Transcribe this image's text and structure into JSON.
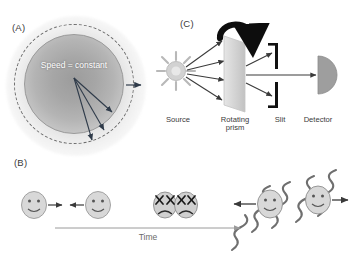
{
  "figure": {
    "background": "#ffffff",
    "panels": [
      {
        "id": "A",
        "label": "(A)"
      },
      {
        "id": "B",
        "label": "(B)"
      },
      {
        "id": "C",
        "label": "(C)"
      }
    ]
  },
  "panel_a": {
    "label": "(A)",
    "caption_text": "Speed = constant",
    "description": "Expanding spherical light wavefront from a point source",
    "ring_style": "dashed",
    "ring_color": "#6e6e6e",
    "disc_fill_center": "#9c9c9c",
    "disc_fill_edge": "#dcdcdc",
    "text_color": "#ffffff",
    "arrow_color": "#2f3b4a",
    "arrow_count": 3,
    "expansion_arrow": "outward-radial-arrow"
  },
  "panel_b": {
    "label": "(B)",
    "axis_label": "Time",
    "axis_color": "#9a9a9a",
    "face_fill": "#d8d8d8",
    "face_stroke": "#8c8c8c",
    "arrow_color": "#3a3a3a",
    "wave_color": "#6f6f6f",
    "stages": [
      {
        "name": "approach",
        "faces": 2,
        "expression": "smiling",
        "motion": "toward-each-other"
      },
      {
        "name": "collision",
        "faces": 2,
        "expression": "x-eyes-frowning",
        "motion": "contact"
      },
      {
        "name": "separate",
        "faces": 2,
        "expression": "smiling",
        "motion": "away-from-each-other",
        "emission": "helical-waves"
      }
    ]
  },
  "panel_c": {
    "label": "(C)",
    "description": "Rotating prism apparatus for measuring the speed of light",
    "components": [
      {
        "name": "source",
        "label": "Source",
        "icon": "sun-burst-icon",
        "fill": "#cfcfcf"
      },
      {
        "name": "rotating-prism",
        "label": "Rotating\nprism",
        "icon": "prism-icon",
        "fill": "#d6d6d6",
        "indicator": "rotation-arrow"
      },
      {
        "name": "slit",
        "label": "Slit",
        "icon": "slit-icon",
        "fill": "#111111"
      },
      {
        "name": "detector",
        "label": "Detector",
        "icon": "detector-icon",
        "fill": "#9e9e9e"
      }
    ],
    "beam_color": "#3a3a3a",
    "rotation_arrow_color": "#0d0d0d"
  }
}
